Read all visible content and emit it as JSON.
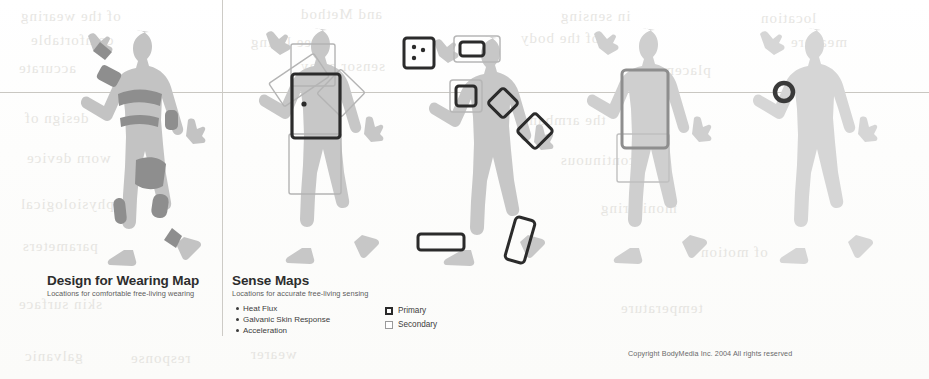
{
  "document": {
    "copyright": "Copyright BodyMedia Inc. 2004 All rights reserved"
  },
  "panels": [
    {
      "id": "design-for-wearing-map",
      "title": "Design for Wearing Map",
      "subtitle": "Locations for comfortable free-living wearing"
    },
    {
      "id": "sense-maps",
      "title": "Sense Maps",
      "subtitle": "Locations for accurate free-living sensing"
    }
  ],
  "sensors": [
    {
      "label": "Heat Flux"
    },
    {
      "label": "Galvanic Skin Response"
    },
    {
      "label": "Acceleration"
    }
  ],
  "legend": [
    {
      "label": "Primary",
      "swatch": "primary-swatch"
    },
    {
      "label": "Secondary",
      "swatch": "secondary-swatch"
    }
  ],
  "figures": [
    {
      "id": "wearing-map-figure",
      "alt": "Human silhouette with shaded comfortable wearing zones"
    },
    {
      "id": "heat-flux-figure",
      "alt": "Human silhouette with torso heat flux sensor rectangles"
    },
    {
      "id": "galvanic-skin-figure",
      "alt": "Human silhouette with galvanic skin response sensor patches"
    },
    {
      "id": "acceleration-figure",
      "alt": "Human silhouette with torso acceleration sensor rectangle"
    },
    {
      "id": "armband-figure",
      "alt": "Human silhouette with upper arm armband sensor ring"
    }
  ],
  "ghost_text": [
    {
      "text": "of the wearing",
      "x": 20,
      "y": 8
    },
    {
      "text": "and Method",
      "x": 300,
      "y": 6
    },
    {
      "text": "in sensing",
      "x": 560,
      "y": 8
    },
    {
      "text": "location",
      "x": 760,
      "y": 10
    },
    {
      "text": "comfortable",
      "x": 30,
      "y": 32
    },
    {
      "text": "free living",
      "x": 250,
      "y": 34
    },
    {
      "text": "of the body",
      "x": 520,
      "y": 30
    },
    {
      "text": "measure",
      "x": 790,
      "y": 34
    },
    {
      "text": "accurate",
      "x": 18,
      "y": 60
    },
    {
      "text": "sensor array",
      "x": 300,
      "y": 58
    },
    {
      "text": "placement",
      "x": 640,
      "y": 62
    },
    {
      "text": "design of",
      "x": 24,
      "y": 110
    },
    {
      "text": "the armband",
      "x": 520,
      "y": 112
    },
    {
      "text": "worn device",
      "x": 26,
      "y": 150
    },
    {
      "text": "continuous",
      "x": 560,
      "y": 152
    },
    {
      "text": "physiological",
      "x": 20,
      "y": 196
    },
    {
      "text": "monitoring",
      "x": 600,
      "y": 200
    },
    {
      "text": "parameters",
      "x": 22,
      "y": 238
    },
    {
      "text": "of motion",
      "x": 700,
      "y": 244
    },
    {
      "text": "skin surface",
      "x": 18,
      "y": 296
    },
    {
      "text": "temperature",
      "x": 620,
      "y": 300
    },
    {
      "text": "galvanic",
      "x": 24,
      "y": 348
    },
    {
      "text": "response",
      "x": 130,
      "y": 350
    },
    {
      "text": "wearer",
      "x": 250,
      "y": 346
    }
  ]
}
